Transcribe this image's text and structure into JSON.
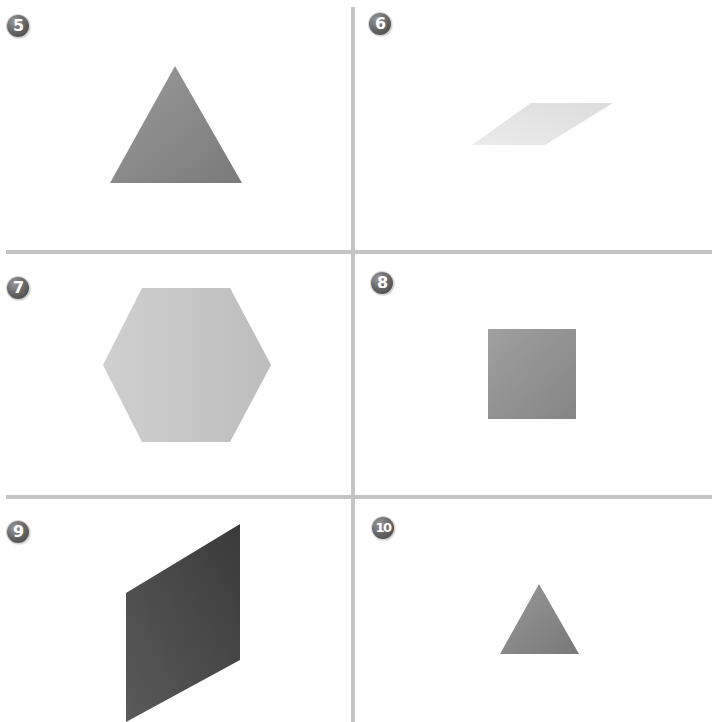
{
  "panels": [
    {
      "number": "5",
      "shape": "triangle",
      "fill": "#7a7a7a",
      "fill_light": "#9a9a9a",
      "points": "175,66 242,183 110,183"
    },
    {
      "number": "6",
      "shape": "parallelogram",
      "fill": "#dcdcdc",
      "fill_light": "#ececec",
      "points": "531,103 613,103 545,145 472,145"
    },
    {
      "number": "7",
      "shape": "hexagon",
      "fill": "#bdbdbd",
      "fill_light": "#cfcfcf",
      "points": "142,288 230,288 271,365 230,442 142,442 103,365"
    },
    {
      "number": "8",
      "shape": "square",
      "fill": "#858585",
      "fill_light": "#a0a0a0",
      "points": "488,329 576,329 576,419 488,419"
    },
    {
      "number": "9",
      "shape": "parallelogram",
      "fill": "#3a3a3a",
      "fill_light": "#5a5a5a",
      "points": "126,593 240,524 240,660 126,722"
    },
    {
      "number": "10",
      "shape": "triangle",
      "fill": "#787878",
      "fill_light": "#999999",
      "points": "539,584 579,654 500,654"
    }
  ],
  "colors": {
    "divider": "#c4c4c4",
    "background": "#ffffff"
  }
}
